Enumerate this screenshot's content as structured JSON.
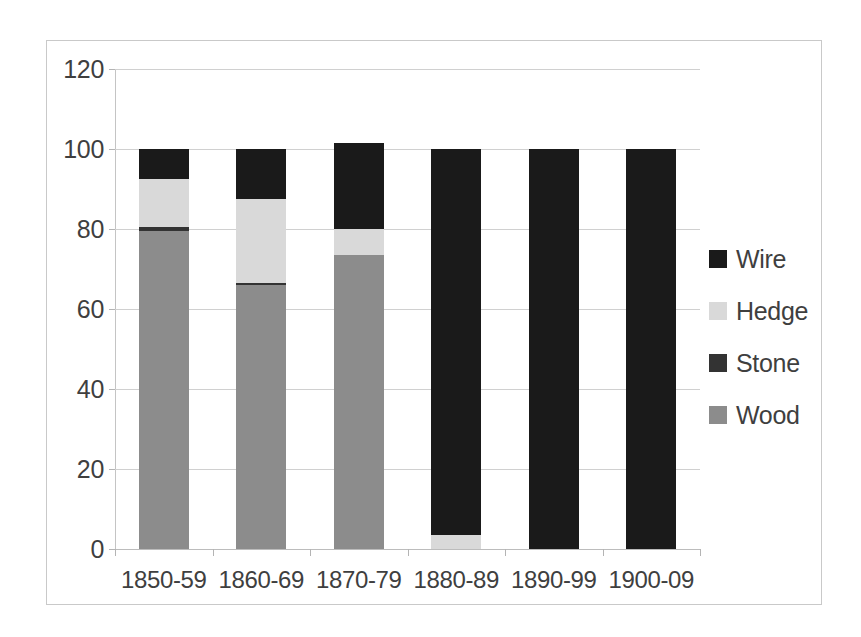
{
  "chart_data": {
    "type": "bar",
    "subtype": "stacked-bar",
    "title": "",
    "subtitle": "",
    "xlabel": "",
    "ylabel": "",
    "categories": [
      "1850-59",
      "1860-69",
      "1870-79",
      "1880-89",
      "1890-99",
      "1900-09"
    ],
    "series": [
      {
        "name": "Wood",
        "color": "#8c8c8c",
        "values": [
          79.5,
          66.0,
          73.5,
          0,
          0,
          0
        ]
      },
      {
        "name": "Stone",
        "color": "#333333",
        "values": [
          1.0,
          0.5,
          0,
          0,
          0,
          0
        ]
      },
      {
        "name": "Hedge",
        "color": "#d9d9d9",
        "values": [
          12.0,
          21.0,
          6.5,
          3.5,
          0,
          0
        ]
      },
      {
        "name": "Wire",
        "color": "#1a1a1a",
        "values": [
          7.5,
          12.5,
          21.5,
          96.5,
          100,
          100
        ]
      }
    ],
    "stack_order_bottom_to_top": [
      "Wood",
      "Stone",
      "Hedge",
      "Wire"
    ],
    "totals": [
      100,
      100,
      101.5,
      100,
      100,
      100
    ],
    "ylim": [
      0,
      120
    ],
    "yticks": [
      0,
      20,
      40,
      60,
      80,
      100,
      120
    ],
    "ytick_labels": [
      "0",
      "20",
      "40",
      "60",
      "80",
      "100",
      "120"
    ],
    "grid": true,
    "grid_axis": "y",
    "legend": {
      "position": "right",
      "entries": [
        {
          "label": "Wire",
          "color": "#1a1a1a"
        },
        {
          "label": "Hedge",
          "color": "#d9d9d9"
        },
        {
          "label": "Stone",
          "color": "#333333"
        },
        {
          "label": "Wood",
          "color": "#8c8c8c"
        }
      ]
    },
    "colors": {
      "wire": "#1a1a1a",
      "hedge": "#d9d9d9",
      "stone": "#333333",
      "wood": "#8c8c8c",
      "grid": "#d0d0d0",
      "axis": "#c4c4c4",
      "text": "#3f3f3f",
      "frame": "#c9c9c9",
      "background": "#ffffff"
    }
  }
}
